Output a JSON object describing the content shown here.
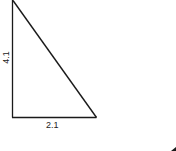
{
  "diagram": {
    "type": "right-triangle",
    "stroke_color": "#1a1a1a",
    "background": "#ffffff",
    "vertices": {
      "top": [
        12,
        1
      ],
      "right_angle": [
        12,
        117
      ],
      "bottom_right": [
        96,
        117
      ]
    },
    "labels": {
      "vertical_side": "4.1",
      "base": "2.1"
    }
  }
}
